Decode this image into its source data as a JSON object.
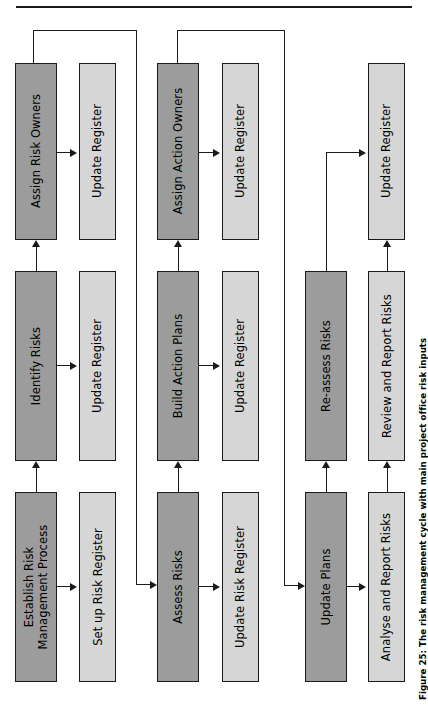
{
  "figure": {
    "caption": "Figure 25: The risk management cycle with main project office risk inputs",
    "top_rule": "horizontal-rule"
  },
  "colors": {
    "process_fill": "#9c9c9c",
    "register_fill": "#d6d6d6",
    "stroke": "#1a1a1a",
    "page": "#ffffff"
  },
  "nodes": {
    "stage1_process": "Establish Risk\nManagement Process",
    "stage1_register": "Set up Risk Register",
    "stage2_process": "Identify Risks",
    "stage2_register": "Update Register",
    "stage3_process": "Assign Risk Owners",
    "stage3_register": "Update Register",
    "stage4_process": "Assess Risks",
    "stage4_register": "Update Risk Register",
    "stage5_process": "Build Action Plans",
    "stage5_register": "Update Register",
    "stage6_process": "Assign Action Owners",
    "stage6_register": "Update Register",
    "stage7_process": "Update Plans",
    "stage7_register": "Analyse and Report Risks",
    "stage8_process": "Re-assess Risks",
    "stage8_register": "Review and Report Risks",
    "stage9_register": "Update Register"
  },
  "connectors": [
    {
      "name": "establish-to-setup-register",
      "kind": "arrow-right"
    },
    {
      "name": "establish-to-identify",
      "kind": "arrow-up"
    },
    {
      "name": "identify-to-update-register",
      "kind": "arrow-right"
    },
    {
      "name": "identify-to-assign-risk-owners",
      "kind": "arrow-up"
    },
    {
      "name": "assign-risk-owners-to-update-register",
      "kind": "arrow-right"
    },
    {
      "name": "assign-risk-owners-feedback-to-assess-risks",
      "kind": "feedback-loop"
    },
    {
      "name": "assess-to-update-risk-register",
      "kind": "arrow-right"
    },
    {
      "name": "assess-to-build-action-plans",
      "kind": "arrow-up"
    },
    {
      "name": "build-action-plans-to-update-register",
      "kind": "arrow-right"
    },
    {
      "name": "build-action-plans-to-assign-action-owners",
      "kind": "arrow-up"
    },
    {
      "name": "assign-action-owners-to-update-register",
      "kind": "arrow-right"
    },
    {
      "name": "assign-action-owners-feedback-to-update-plans",
      "kind": "feedback-loop"
    },
    {
      "name": "update-plans-to-analyse-and-report",
      "kind": "arrow-right"
    },
    {
      "name": "update-plans-to-re-assess-risks",
      "kind": "arrow-up"
    },
    {
      "name": "analyse-to-review-and-report-risks",
      "kind": "arrow-up"
    },
    {
      "name": "re-assess-risks-to-update-register",
      "kind": "arrow-right"
    }
  ]
}
